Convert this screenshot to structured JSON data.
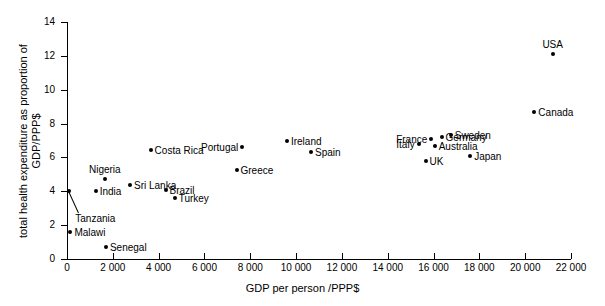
{
  "chart_data": {
    "type": "scatter",
    "title": "",
    "xlabel": "GDP per person /PPP$",
    "ylabel": "total health expenditure as proportion of GDP/PPP$",
    "xlim": [
      0,
      22000
    ],
    "ylim": [
      0,
      14
    ],
    "xticks": [
      "0",
      "2 000",
      "4 000",
      "6 000",
      "8 000",
      "10 000",
      "12 000",
      "14 000",
      "16 000",
      "18 000",
      "20 000",
      "22 000"
    ],
    "xtick_values": [
      0,
      2000,
      4000,
      6000,
      8000,
      10000,
      12000,
      14000,
      16000,
      18000,
      20000,
      22000
    ],
    "yticks": [
      "0",
      "2",
      "4",
      "6",
      "8",
      "10",
      "12",
      "14"
    ],
    "ytick_values": [
      0,
      2,
      4,
      6,
      8,
      10,
      12,
      14
    ],
    "grid": false,
    "legend": "none",
    "marker_color": "#000000",
    "points": [
      {
        "label": "Malawi",
        "x": 150,
        "y": 1.6,
        "label_pos": "right"
      },
      {
        "label": "Senegal",
        "x": 1700,
        "y": 0.7,
        "label_pos": "right"
      },
      {
        "label": "Tanzania",
        "x": 100,
        "y": 4.0,
        "label_pos": "leader"
      },
      {
        "label": "India",
        "x": 1250,
        "y": 4.0,
        "label_pos": "right"
      },
      {
        "label": "Nigeria",
        "x": 1650,
        "y": 4.7,
        "label_pos": "above"
      },
      {
        "label": "Sri Lanka",
        "x": 2750,
        "y": 4.4,
        "label_pos": "right"
      },
      {
        "label": "Costa Rica",
        "x": 3650,
        "y": 6.45,
        "label_pos": "right"
      },
      {
        "label": "Brazil",
        "x": 4300,
        "y": 4.1,
        "label_pos": "right"
      },
      {
        "label": "Turkey",
        "x": 4700,
        "y": 3.6,
        "label_pos": "right"
      },
      {
        "label": "Greece",
        "x": 7400,
        "y": 5.25,
        "label_pos": "right"
      },
      {
        "label": "Portugal",
        "x": 7650,
        "y": 6.6,
        "label_pos": "left"
      },
      {
        "label": "Ireland",
        "x": 9600,
        "y": 7.0,
        "label_pos": "right"
      },
      {
        "label": "Spain",
        "x": 10650,
        "y": 6.3,
        "label_pos": "right"
      },
      {
        "label": "Italy",
        "x": 15350,
        "y": 6.8,
        "label_pos": "left"
      },
      {
        "label": "France",
        "x": 15900,
        "y": 7.1,
        "label_pos": "left"
      },
      {
        "label": "UK",
        "x": 15650,
        "y": 5.8,
        "label_pos": "right"
      },
      {
        "label": "Australia",
        "x": 16050,
        "y": 6.7,
        "label_pos": "right"
      },
      {
        "label": "Germany",
        "x": 16350,
        "y": 7.2,
        "label_pos": "right"
      },
      {
        "label": "Sweden",
        "x": 16750,
        "y": 7.3,
        "label_pos": "right"
      },
      {
        "label": "Japan",
        "x": 17600,
        "y": 6.1,
        "label_pos": "right"
      },
      {
        "label": "Canada",
        "x": 20400,
        "y": 8.7,
        "label_pos": "right"
      },
      {
        "label": "USA",
        "x": 21200,
        "y": 12.1,
        "label_pos": "above"
      }
    ]
  }
}
